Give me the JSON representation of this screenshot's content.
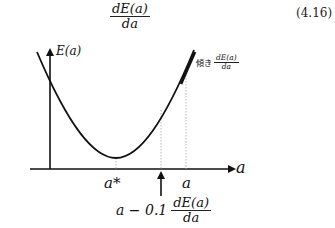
{
  "equation": {
    "numerator": "dE(a)",
    "denominator": "da",
    "number": "(4.16)"
  },
  "figure": {
    "y_axis_label": "E(a)",
    "x_axis_label": "a",
    "min_label": "a*",
    "point_label": "a",
    "slope_annotation": {
      "prefix": "傾き",
      "numerator": "dE(a)",
      "denominator": "da"
    },
    "update_rule": {
      "prefix": "a − 0.1",
      "numerator": "dE(a)",
      "denominator": "da"
    },
    "colors": {
      "curve": "#111111",
      "axis": "#111111",
      "guide": "#aaaaaa"
    }
  }
}
